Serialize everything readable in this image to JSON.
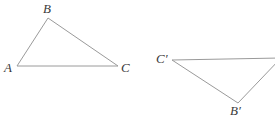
{
  "figure": {
    "type": "geometry-diagram",
    "background_color": "#ffffff",
    "stroke_color": "#9a9a9a",
    "label_color": "#3a3a3a",
    "stroke_width": 1,
    "canvas": {
      "width": 275,
      "height": 123
    },
    "shapes": [
      {
        "name": "triangle-abc",
        "closed": true,
        "points": "17,66 48,18 118,66",
        "vertices": [
          {
            "key": "A",
            "x": 17,
            "y": 66
          },
          {
            "key": "B",
            "x": 48,
            "y": 18
          },
          {
            "key": "C",
            "x": 118,
            "y": 66
          }
        ]
      },
      {
        "name": "triangle-a-prime-b-prime-c-prime",
        "closed": false,
        "points": "172,60 281,58 238,103 172,60",
        "vertices": [
          {
            "key": "C'",
            "x": 172,
            "y": 60
          },
          {
            "key": "A'",
            "x": 281,
            "y": 58
          },
          {
            "key": "B'",
            "x": 238,
            "y": 103
          }
        ],
        "note": "A' vertex falls outside the right edge of the image"
      }
    ],
    "labels": [
      {
        "id": "label-a",
        "text": "A",
        "x": 4,
        "y": 61
      },
      {
        "id": "label-b",
        "text": "B",
        "x": 43,
        "y": 2
      },
      {
        "id": "label-c",
        "text": "C",
        "x": 121,
        "y": 61
      },
      {
        "id": "label-c-prime",
        "text": "C′",
        "x": 156,
        "y": 52
      },
      {
        "id": "label-b-prime",
        "text": "B′",
        "x": 230,
        "y": 104
      }
    ]
  }
}
